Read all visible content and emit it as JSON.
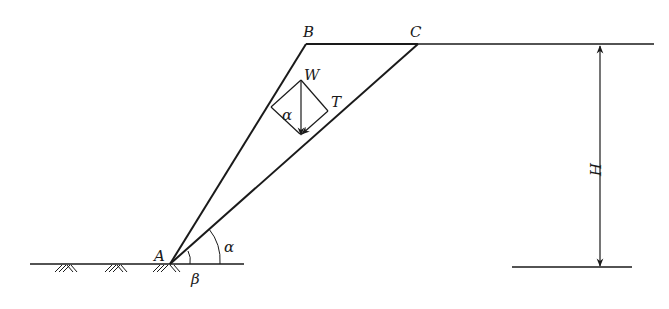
{
  "diagram": {
    "points": {
      "A": {
        "label": "A",
        "x": 170,
        "y": 264
      },
      "B": {
        "label": "B",
        "x": 306,
        "y": 44
      },
      "C": {
        "label": "C",
        "x": 418,
        "y": 44
      }
    },
    "labels": {
      "A": "A",
      "B": "B",
      "C": "C",
      "W": "W",
      "T": "T",
      "alpha_force": "α",
      "alpha_base": "α",
      "beta": "β",
      "H": "H"
    },
    "forces": [
      "W (weight, vertical)",
      "T (component along slip plane)"
    ],
    "angles": [
      "α (slip plane inclination)",
      "β (slope face inclination)"
    ],
    "dimension": "H (slope height)",
    "colors": {
      "line": "#1a1a1a",
      "background": "#ffffff"
    }
  }
}
